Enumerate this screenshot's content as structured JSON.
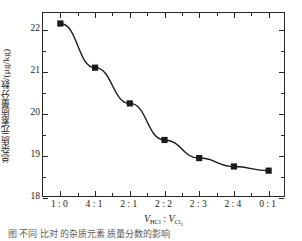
{
  "chart_data": {
    "type": "line",
    "title": "",
    "subtitle": "",
    "xlabel": "V_HCl : V_Cl2",
    "xlabel_parts": {
      "v1": "V",
      "v1_sub": "HCl",
      "separator": " : ",
      "v2": "V",
      "v2_sub": "Cl",
      "v2_sub_sub": "2"
    },
    "ylabel": "总杂质元素质量分数/(μg/kg)",
    "categories": [
      "1 : 0",
      "4 : 1",
      "2 : 1",
      "2 : 2",
      "2 : 3",
      "2 : 4",
      "0 : 1"
    ],
    "values": [
      22.15,
      21.1,
      20.25,
      19.38,
      18.95,
      18.75,
      18.65
    ],
    "series": [
      {
        "name": "总杂质元素质量分数",
        "values": [
          22.15,
          21.1,
          20.25,
          19.38,
          18.95,
          18.75,
          18.65
        ],
        "marker": "filled-square",
        "color": "#1a1a1a"
      }
    ],
    "ylim": [
      18,
      22.4
    ],
    "yticks": [
      18,
      19,
      20,
      21,
      22
    ],
    "ytick_labels": [
      "18",
      "19",
      "20",
      "21",
      "22"
    ],
    "y_minor_ticks": [
      18.5,
      19.5,
      20.5,
      21.5
    ],
    "grid": false,
    "legend": null,
    "legend_position": "none",
    "frame": "box",
    "tick_direction": "in-out"
  },
  "caption": {
    "text": "图    不同    比对    的杂质元素    质量分数的影响"
  }
}
